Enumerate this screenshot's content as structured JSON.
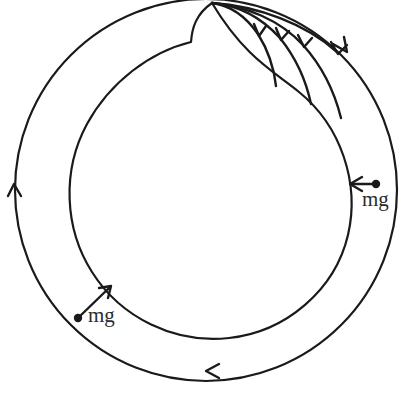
{
  "figure": {
    "type": "physics-free-body-diagram",
    "background_color": "#ffffff",
    "ink_color": "#1a1a1a",
    "width": 415,
    "height": 399
  },
  "geometry": {
    "outer_ring": {
      "name": "outer-circular-path",
      "center_x": 206,
      "center_y": 190,
      "radius": 191
    },
    "inner_ring": {
      "name": "inner-circular-path",
      "center_x": 208,
      "center_y": 188,
      "radius": 143,
      "cusp_x": 212,
      "cusp_y": 3,
      "kink_x": 191,
      "kink_y": 42
    }
  },
  "flow_arrows": {
    "description": "direction-of-travel arrowheads on the outer circular path",
    "items": [
      {
        "label": "left-side-upward",
        "x": 14,
        "y": 186,
        "direction": "up"
      },
      {
        "label": "bottom-leftward",
        "x": 208,
        "y": 371,
        "direction": "left"
      },
      {
        "label": "top-right-downward",
        "x": 346,
        "y": 49,
        "direction": "down-right"
      }
    ]
  },
  "fan_arrows": {
    "description": "family of curved trajectory arrows fanning out from the top vertex",
    "count": 4,
    "origin_x": 212,
    "origin_y": 3,
    "arrowheads": [
      {
        "index": 1,
        "x": 259,
        "y": 35
      },
      {
        "index": 2,
        "x": 281,
        "y": 39
      },
      {
        "index": 3,
        "x": 304,
        "y": 46
      },
      {
        "index": 4,
        "x": 338,
        "y": 52
      }
    ]
  },
  "force_vectors": [
    {
      "name": "weight-vector-right",
      "label": "mg",
      "anchor_x": 376,
      "anchor_y": 184,
      "tip_x": 350,
      "tip_y": 184,
      "direction": "left",
      "label_x": 362,
      "label_y": 189
    },
    {
      "name": "weight-vector-lower-left",
      "label": "mg",
      "anchor_x": 78,
      "anchor_y": 318,
      "tip_x": 110,
      "tip_y": 287,
      "direction": "up-right",
      "label_x": 88,
      "label_y": 305
    }
  ],
  "labels": {
    "weight_right": "mg",
    "weight_lower_left": "mg"
  }
}
